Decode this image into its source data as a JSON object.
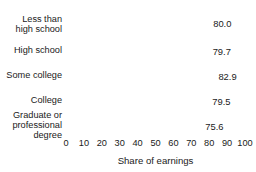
{
  "chart_data": {
    "type": "bar",
    "orientation": "horizontal",
    "title": "",
    "subtitle": "",
    "xlabel": "Share of earnings",
    "ylabel": "",
    "categories": [
      "Less than\nhigh school",
      "High school",
      "Some college",
      "College",
      "Graduate or\nprofessional\ndegree"
    ],
    "values": [
      80.0,
      79.7,
      82.9,
      79.5,
      75.6
    ],
    "value_labels": [
      "80.0",
      "79.7",
      "82.9",
      "79.5",
      "75.6"
    ],
    "xlim": [
      0,
      100
    ],
    "xticks": [
      0,
      10,
      20,
      30,
      40,
      50,
      60,
      70,
      80,
      90,
      100
    ],
    "xtick_labels": [
      "0",
      "10",
      "20",
      "30",
      "40",
      "50",
      "60",
      "70",
      "80",
      "90",
      "100"
    ],
    "grid": true,
    "grid_orientation": "vertical",
    "legend": false,
    "colors": {
      "bar": "#808080",
      "grid": "#ffffff",
      "text": "#1a1a1a",
      "background": "#ffffff"
    }
  }
}
